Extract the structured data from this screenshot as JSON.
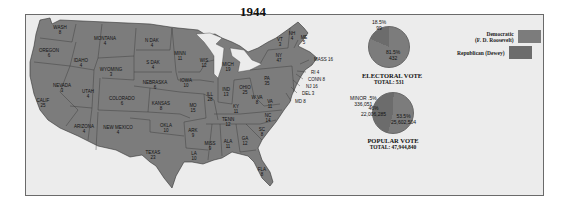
{
  "title": "1944",
  "colors": {
    "democratic": "#7c7c7c",
    "republican": "#6c6c6c",
    "background": "#ececec",
    "water": "#e8e8e8"
  },
  "legend": [
    {
      "label_line1": "Democratic",
      "label_line2": "(F. D. Roosevelt)",
      "color": "#7c7c7c"
    },
    {
      "label_line1": "Republican (Dewey)",
      "label_line2": "",
      "color": "#6c6c6c"
    }
  ],
  "states": [
    {
      "name": "WASH",
      "votes": "8",
      "x": 60,
      "y": 30
    },
    {
      "name": "OREGON",
      "votes": "6",
      "x": 49,
      "y": 53
    },
    {
      "name": "CALIF",
      "votes": "25",
      "x": 43,
      "y": 103
    },
    {
      "name": "IDAHO",
      "votes": "4",
      "x": 81,
      "y": 63
    },
    {
      "name": "NEVADA",
      "votes": "3",
      "x": 62,
      "y": 88
    },
    {
      "name": "MONTANA",
      "votes": "4",
      "x": 105,
      "y": 41
    },
    {
      "name": "WYOMING",
      "votes": "3",
      "x": 111,
      "y": 72
    },
    {
      "name": "UTAH",
      "votes": "4",
      "x": 88,
      "y": 94
    },
    {
      "name": "COLORADO",
      "votes": "6",
      "x": 122,
      "y": 101
    },
    {
      "name": "ARIZONA",
      "votes": "4",
      "x": 84,
      "y": 129
    },
    {
      "name": "NEW MEXICO",
      "votes": "4",
      "x": 118,
      "y": 130
    },
    {
      "name": "N DAK",
      "votes": "4",
      "x": 152,
      "y": 43
    },
    {
      "name": "S DAK",
      "votes": "4",
      "x": 153,
      "y": 65
    },
    {
      "name": "NEBRASKA",
      "votes": "6",
      "x": 155,
      "y": 85
    },
    {
      "name": "KANSAS",
      "votes": "8",
      "x": 161,
      "y": 106
    },
    {
      "name": "OKLA",
      "votes": "10",
      "x": 166,
      "y": 128
    },
    {
      "name": "TEXAS",
      "votes": "23",
      "x": 153,
      "y": 155
    },
    {
      "name": "MINN",
      "votes": "11",
      "x": 180,
      "y": 56
    },
    {
      "name": "IOWA",
      "votes": "10",
      "x": 186,
      "y": 83
    },
    {
      "name": "MO",
      "votes": "15",
      "x": 193,
      "y": 108
    },
    {
      "name": "ARK",
      "votes": "9",
      "x": 193,
      "y": 133
    },
    {
      "name": "LA",
      "votes": "10",
      "x": 194,
      "y": 156
    },
    {
      "name": "WIS",
      "votes": "12",
      "x": 204,
      "y": 63
    },
    {
      "name": "ILL",
      "votes": "28",
      "x": 210,
      "y": 97
    },
    {
      "name": "MICH",
      "votes": "19",
      "x": 228,
      "y": 67
    },
    {
      "name": "IND",
      "votes": "13",
      "x": 226,
      "y": 92
    },
    {
      "name": "OHIO",
      "votes": "25",
      "x": 245,
      "y": 90
    },
    {
      "name": "KY",
      "votes": "11",
      "x": 236,
      "y": 109
    },
    {
      "name": "TENN",
      "votes": "12",
      "x": 228,
      "y": 122
    },
    {
      "name": "MISS",
      "votes": "9",
      "x": 210,
      "y": 146
    },
    {
      "name": "ALA",
      "votes": "11",
      "x": 228,
      "y": 144
    },
    {
      "name": "GA",
      "votes": "12",
      "x": 245,
      "y": 141
    },
    {
      "name": "FLA",
      "votes": "8",
      "x": 262,
      "y": 172
    },
    {
      "name": "SC",
      "votes": "8",
      "x": 262,
      "y": 132
    },
    {
      "name": "NC",
      "votes": "14",
      "x": 268,
      "y": 118
    },
    {
      "name": "VA",
      "votes": "11",
      "x": 270,
      "y": 104
    },
    {
      "name": "W VA",
      "votes": "8",
      "x": 257,
      "y": 100
    },
    {
      "name": "PA",
      "votes": "35",
      "x": 267,
      "y": 81
    },
    {
      "name": "NY",
      "votes": "47",
      "x": 279,
      "y": 58
    },
    {
      "name": "VT",
      "votes": "3",
      "x": 280,
      "y": 42
    },
    {
      "name": "NH",
      "votes": "4",
      "x": 292,
      "y": 36
    },
    {
      "name": "ME",
      "votes": "5",
      "x": 304,
      "y": 40
    }
  ],
  "callouts": [
    {
      "label": "MASS 16",
      "x": 314,
      "y": 59
    },
    {
      "name": "RI",
      "label": "RI 4",
      "x": 311,
      "y": 72
    },
    {
      "label": "CONN 8",
      "x": 308,
      "y": 79
    },
    {
      "label": "NJ 16",
      "x": 306,
      "y": 86
    },
    {
      "label": "DEL 3",
      "x": 302,
      "y": 93
    },
    {
      "label": "MD 8",
      "x": 295,
      "y": 101
    }
  ],
  "electoral_vote": {
    "title": "ELECTORAL VOTE",
    "total_label": "TOTAL: 531",
    "republican_pct": "18.5%",
    "republican_votes": "99",
    "democratic_pct": "81.5%",
    "democratic_votes": "432"
  },
  "popular_vote": {
    "title": "POPULAR VOTE",
    "total_label": "TOTAL: 47,944,840",
    "minor_pct": "MINOR .5%",
    "minor_votes": "336,051",
    "republican_pct": "46%",
    "republican_votes": "22,006,285",
    "democratic_pct": "53.5%",
    "democratic_votes": "25,602,504"
  },
  "chart_data": [
    {
      "type": "pie",
      "title": "ELECTORAL VOTE",
      "subtitle": "TOTAL: 531",
      "categories": [
        "Democratic (F. D. Roosevelt)",
        "Republican (Dewey)"
      ],
      "values": [
        432,
        99
      ],
      "percentages": [
        81.5,
        18.5
      ]
    },
    {
      "type": "pie",
      "title": "POPULAR VOTE",
      "subtitle": "TOTAL: 47,944,840",
      "categories": [
        "Democratic (F. D. Roosevelt)",
        "Republican (Dewey)",
        "Minor"
      ],
      "values": [
        25602504,
        22006285,
        336051
      ],
      "percentages": [
        53.5,
        46,
        0.5
      ]
    }
  ]
}
